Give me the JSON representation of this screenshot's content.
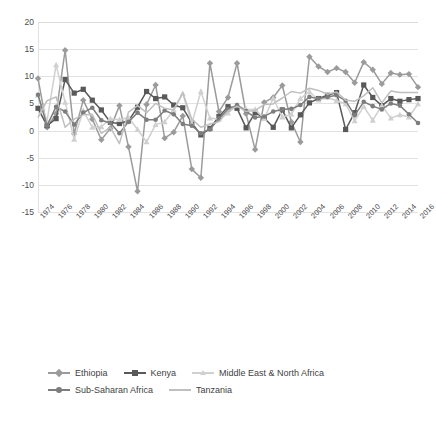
{
  "chart_data": {
    "type": "line",
    "title": "",
    "subtitle": "",
    "xlabel": "",
    "ylabel": "",
    "xlim": [
      1974,
      2016
    ],
    "ylim": [
      -15,
      20
    ],
    "yticks": [
      20,
      15,
      10,
      5,
      0,
      -5,
      -10,
      -15
    ],
    "xticks": [
      1974,
      1976,
      1978,
      1980,
      1982,
      1984,
      1986,
      1988,
      1990,
      1992,
      1994,
      1996,
      1998,
      2000,
      2002,
      2004,
      2006,
      2008,
      2010,
      2012,
      2014,
      2016
    ],
    "grid": true,
    "legend_position": "bottom-left",
    "x": [
      1974,
      1975,
      1976,
      1977,
      1978,
      1979,
      1980,
      1981,
      1982,
      1983,
      1984,
      1985,
      1986,
      1987,
      1988,
      1989,
      1990,
      1991,
      1992,
      1993,
      1994,
      1995,
      1996,
      1997,
      1998,
      1999,
      2000,
      2001,
      2002,
      2003,
      2004,
      2005,
      2006,
      2007,
      2008,
      2009,
      2010,
      2011,
      2012,
      2013,
      2014,
      2015,
      2016
    ],
    "series": [
      {
        "name": "Ethiopia",
        "color": "#9b9b9b",
        "marker": "diamond",
        "values": [
          9.6,
          0.6,
          3.1,
          14.8,
          -0.6,
          5.6,
          2.1,
          -1.7,
          0.4,
          4.6,
          -3.0,
          -11.2,
          4.8,
          8.4,
          -1.4,
          -0.3,
          2.7,
          -7.1,
          -8.7,
          12.4,
          3.5,
          6.1,
          12.4,
          3.1,
          -3.5,
          5.2,
          6.1,
          8.3,
          1.6,
          -2.1,
          13.6,
          11.8,
          10.8,
          11.5,
          10.8,
          8.8,
          12.6,
          11.2,
          8.6,
          10.6,
          10.3,
          10.4,
          8.0
        ]
      },
      {
        "name": "Kenya",
        "color": "#595959",
        "marker": "square",
        "values": [
          4.1,
          0.9,
          2.2,
          9.4,
          6.9,
          7.6,
          5.6,
          3.8,
          1.5,
          1.3,
          1.8,
          4.3,
          7.2,
          5.9,
          6.2,
          4.7,
          4.2,
          1.4,
          -0.8,
          0.4,
          2.6,
          4.4,
          4.1,
          0.5,
          3.3,
          2.3,
          0.6,
          3.8,
          0.5,
          2.9,
          5.1,
          5.9,
          6.5,
          7.0,
          0.2,
          3.3,
          8.4,
          6.1,
          4.6,
          5.9,
          5.4,
          5.7,
          5.9
        ]
      },
      {
        "name": "Middle East & North Africa",
        "color": "#d0d0d0",
        "marker": "triangle",
        "values": [
          6.5,
          1.8,
          12.1,
          5.2,
          -1.6,
          3.7,
          0.6,
          0.7,
          2.2,
          2.0,
          2.4,
          0.2,
          -2.1,
          1.1,
          1.6,
          3.8,
          6.8,
          1.3,
          7.2,
          2.3,
          2.1,
          3.2,
          4.7,
          3.9,
          3.9,
          2.2,
          5.9,
          2.5,
          3.0,
          5.9,
          7.2,
          5.6,
          6.1,
          5.5,
          4.9,
          1.8,
          4.4,
          1.9,
          4.6,
          2.3,
          2.9,
          2.5,
          4.9
        ]
      },
      {
        "name": "Sub-Saharan Africa",
        "color": "#7d7d7d",
        "marker": "circle",
        "values": [
          6.6,
          0.9,
          4.4,
          3.5,
          1.1,
          3.3,
          4.2,
          1.9,
          1.4,
          -0.5,
          1.6,
          3.3,
          2.0,
          2.0,
          3.7,
          3.0,
          1.2,
          0.9,
          -0.5,
          0.2,
          2.2,
          3.9,
          4.7,
          3.6,
          2.4,
          2.6,
          3.5,
          3.9,
          4.0,
          4.7,
          6.2,
          5.9,
          6.2,
          6.5,
          5.5,
          2.8,
          5.3,
          4.5,
          3.9,
          5.0,
          4.6,
          3.0,
          1.4
        ]
      },
      {
        "name": "Tanzania",
        "color": "#bfbfbf",
        "marker": "none",
        "values": [
          2.4,
          5.5,
          6.2,
          0.6,
          2.1,
          2.9,
          3.0,
          -0.5,
          0.6,
          -2.4,
          3.4,
          4.6,
          3.3,
          5.0,
          4.1,
          3.8,
          7.0,
          2.1,
          0.6,
          1.2,
          1.6,
          3.6,
          4.5,
          3.5,
          3.7,
          4.8,
          4.9,
          6.0,
          7.2,
          6.9,
          7.8,
          7.4,
          6.7,
          7.1,
          5.6,
          5.4,
          6.4,
          7.9,
          5.1,
          7.3,
          7.0,
          7.0,
          7.0
        ]
      }
    ]
  },
  "legend": {
    "rows": [
      [
        {
          "label": "Ethiopia",
          "color": "#9b9b9b",
          "marker": "diamond"
        },
        {
          "label": "Kenya",
          "color": "#595959",
          "marker": "square"
        },
        {
          "label": "Middle East & North Africa",
          "color": "#d0d0d0",
          "marker": "triangle"
        }
      ],
      [
        {
          "label": "Sub-Saharan Africa",
          "color": "#7d7d7d",
          "marker": "circle"
        },
        {
          "label": "Tanzania",
          "color": "#bfbfbf",
          "marker": "none"
        }
      ]
    ]
  },
  "caption": {
    "text": ""
  }
}
